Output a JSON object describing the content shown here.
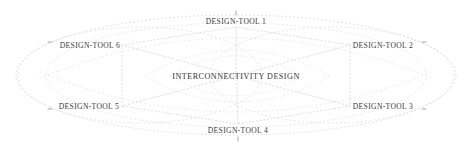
{
  "diagram": {
    "title": "INTERCONNECTIVITY DESIGN",
    "center": {
      "label": "INTERCONNECTIVITY DESIGN",
      "x": 236,
      "y": 76
    },
    "style": {
      "line_color": "#c9c9cf",
      "line_style": "dotted",
      "text_color": "#3a3a3a",
      "background": "#ffffff",
      "outer_ellipse_color": "#d2d2d8"
    },
    "nodes": [
      {
        "id": "tool-1",
        "label": "DESIGN-TOOL 1",
        "x": 236,
        "y": 21,
        "position": "top-center"
      },
      {
        "id": "tool-2",
        "label": "DESIGN-TOOL 2",
        "x": 383,
        "y": 45,
        "position": "right-upper"
      },
      {
        "id": "tool-3",
        "label": "DESIGN-TOOL 3",
        "x": 383,
        "y": 106,
        "position": "right-lower"
      },
      {
        "id": "tool-4",
        "label": "DESIGN-TOOL 4",
        "x": 238,
        "y": 130,
        "position": "bottom-center"
      },
      {
        "id": "tool-5",
        "label": "DESIGN-TOOL 5",
        "x": 89,
        "y": 106,
        "position": "left-lower"
      },
      {
        "id": "tool-6",
        "label": "DESIGN-TOOL 6",
        "x": 90,
        "y": 45,
        "position": "left-upper"
      }
    ],
    "connections": [
      {
        "from": "center",
        "to": "tool-1"
      },
      {
        "from": "center",
        "to": "tool-2"
      },
      {
        "from": "center",
        "to": "tool-3"
      },
      {
        "from": "center",
        "to": "tool-4"
      },
      {
        "from": "center",
        "to": "tool-5"
      },
      {
        "from": "center",
        "to": "tool-6"
      },
      {
        "from": "tool-6",
        "to": "tool-1"
      },
      {
        "from": "tool-1",
        "to": "tool-2"
      },
      {
        "from": "tool-2",
        "to": "tool-3"
      },
      {
        "from": "tool-3",
        "to": "tool-4"
      },
      {
        "from": "tool-4",
        "to": "tool-5"
      },
      {
        "from": "tool-5",
        "to": "tool-6"
      }
    ]
  }
}
